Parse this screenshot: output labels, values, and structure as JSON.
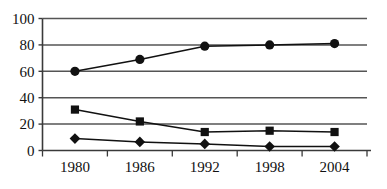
{
  "chart_data": {
    "type": "line",
    "title": "",
    "subtitle": "",
    "xlabel": "",
    "ylabel": "",
    "categories": [
      "1980",
      "1986",
      "1992",
      "1998",
      "2004"
    ],
    "x_tick_labels": [
      "1980",
      "1986",
      "1992",
      "1998",
      "2004"
    ],
    "y_tick_labels": [
      "0",
      "20",
      "40",
      "60",
      "80",
      "100"
    ],
    "y_ticks": [
      0,
      20,
      40,
      60,
      80,
      100
    ],
    "ylim": [
      0,
      100
    ],
    "grid": "horizontal",
    "legend": "none",
    "series": [
      {
        "name": "circle-series",
        "marker": "circle",
        "color": "#111111",
        "values": [
          60,
          69,
          79,
          80,
          81
        ]
      },
      {
        "name": "square-series",
        "marker": "square",
        "color": "#111111",
        "values": [
          31,
          22,
          14,
          15,
          14
        ]
      },
      {
        "name": "diamond-series",
        "marker": "diamond",
        "color": "#111111",
        "values": [
          9,
          6.5,
          5,
          3,
          3
        ]
      }
    ],
    "colors": {
      "background": "#ffffff",
      "axis": "#3a3a3a",
      "gridline": "#555555",
      "marker": "#111111",
      "line": "#111111",
      "tick_text": "#111111"
    }
  }
}
